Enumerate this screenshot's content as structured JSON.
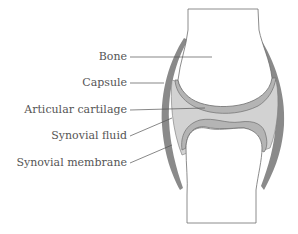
{
  "diagram": {
    "labels": [
      {
        "id": "bone",
        "text": "Bone"
      },
      {
        "id": "capsule",
        "text": "Capsule"
      },
      {
        "id": "articular-cartilage",
        "text": "Articular cartilage"
      },
      {
        "id": "synovial-fluid",
        "text": "Synovial fluid"
      },
      {
        "id": "synovial-membrane",
        "text": "Synovial membrane"
      }
    ],
    "colors": {
      "capsule": "#8a8a8a",
      "cartilage": "#b4b4b4",
      "fluid": "#d2d2d2",
      "bone": "#ffffff",
      "outline": "#6e6e6e",
      "text": "#555555"
    }
  }
}
